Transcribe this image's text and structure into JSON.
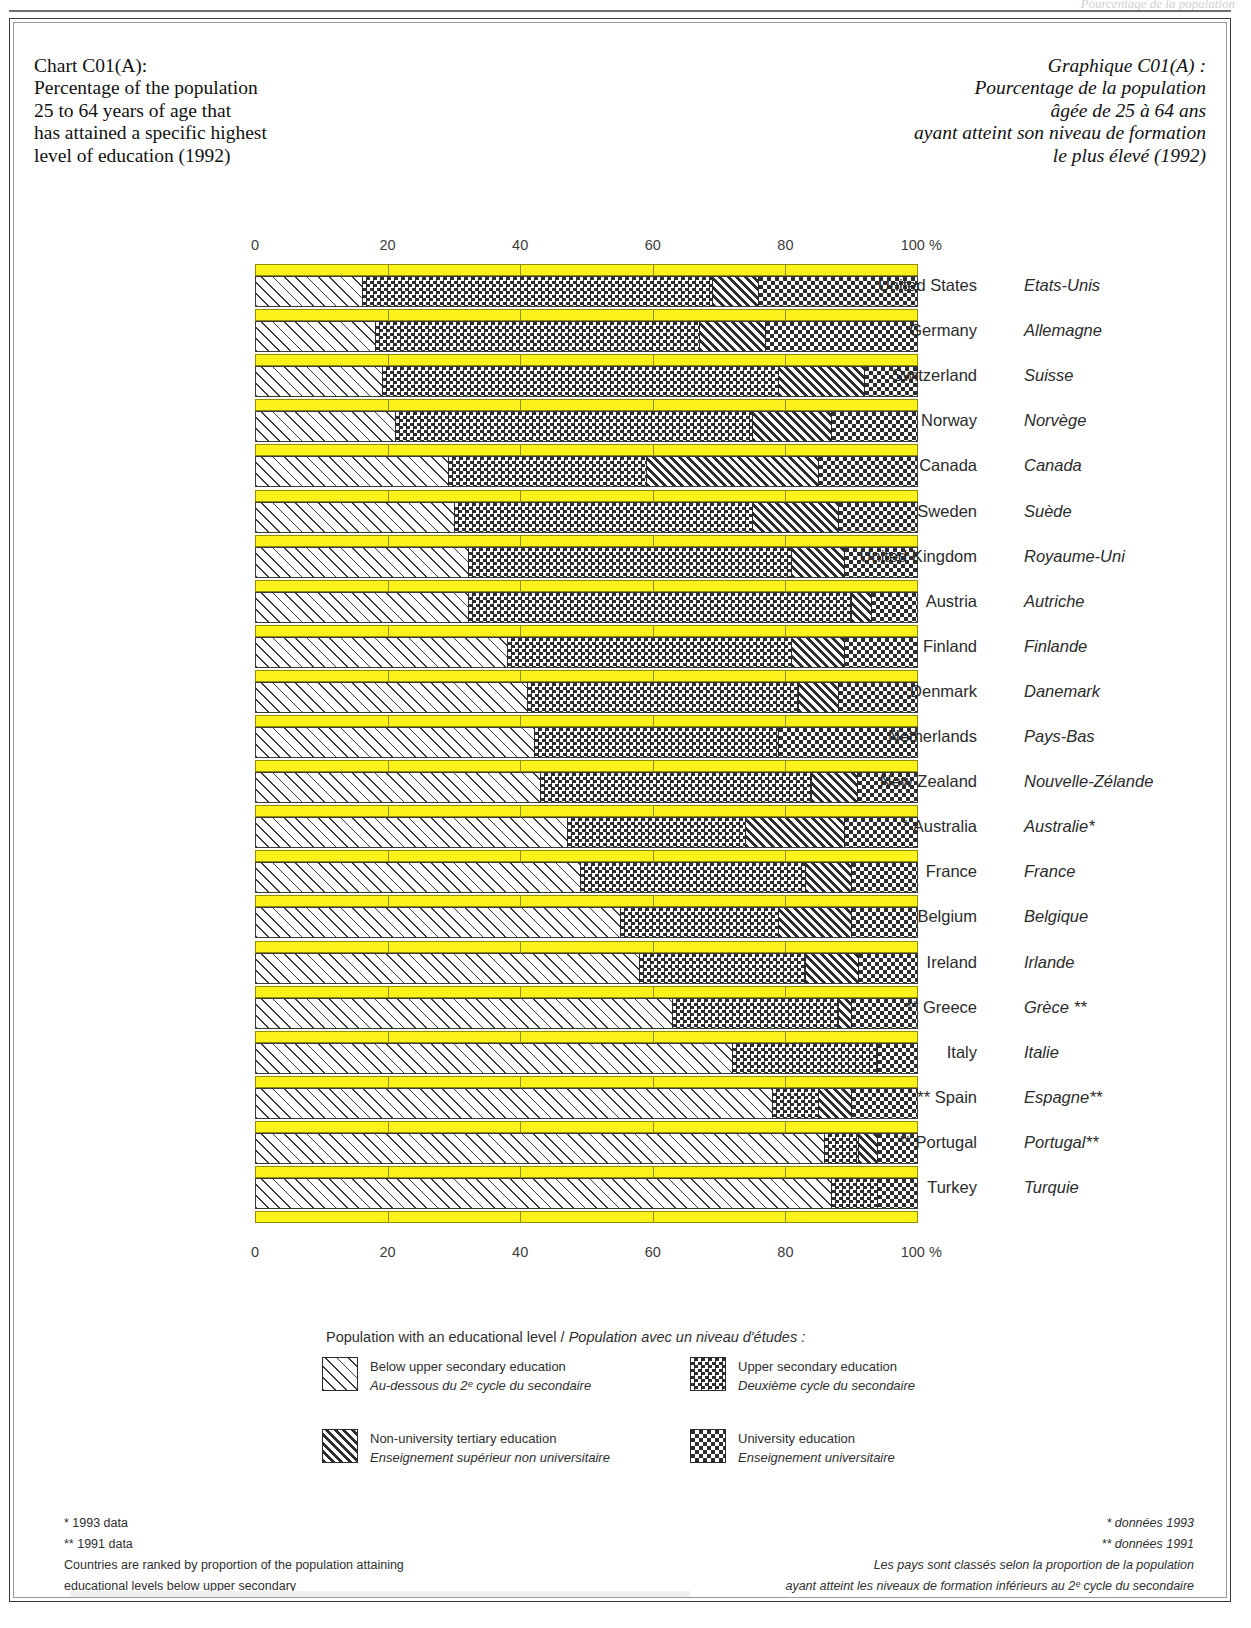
{
  "header_ghost": "Pourcentage de la population",
  "title_en": [
    "Chart C01(A):",
    "Percentage of the population",
    "25 to 64 years of age that",
    "has attained a specific highest",
    "level of education (1992)"
  ],
  "title_fr": [
    "Graphique C01(A) :",
    "Pourcentage de la population",
    "âgée de 25 à 64 ans",
    "ayant atteint son niveau de formation",
    "le plus élevé (1992)"
  ],
  "axis": {
    "ticks": [
      "0",
      "20",
      "40",
      "60",
      "80",
      "100 %"
    ],
    "tick_values": [
      0,
      20,
      40,
      60,
      80,
      100
    ]
  },
  "legend": {
    "title_en": "Population with an educational level",
    "separator": "/",
    "title_fr": "Population avec un niveau d'études :",
    "items": [
      {
        "key": "below",
        "en": "Below upper secondary education",
        "fr": "Au-dessous du 2ᵉ cycle du secondaire"
      },
      {
        "key": "upper",
        "en": "Upper secondary education",
        "fr": "Deuxième cycle du secondaire"
      },
      {
        "key": "nonuni",
        "en": "Non-university tertiary education",
        "fr": "Enseignement supérieur non universitaire"
      },
      {
        "key": "uni",
        "en": "University education",
        "fr": "Enseignement universitaire"
      }
    ]
  },
  "footnotes_en": [
    "* 1993 data",
    "** 1991 data",
    "Countries are ranked by proportion of the population attaining",
    "educational levels below upper secondary"
  ],
  "footnotes_fr": [
    "* données 1993",
    "** données 1991",
    "Les pays sont classés selon la proportion de la population",
    "ayant atteint les niveaux de formation inférieurs au 2ᵉ cycle du secondaire"
  ],
  "colors": {
    "yellow": "#FBF21C",
    "yellow_border": "#8F8F00",
    "ink": "#2E2E2E",
    "frame": "#3A3A3A"
  },
  "chart_data": {
    "type": "bar",
    "orientation": "horizontal",
    "stacked": true,
    "xlabel": "%",
    "ylabel": "",
    "xlim": [
      0,
      100
    ],
    "grid": true,
    "legend_position": "bottom",
    "series": [
      {
        "name": "Below upper secondary education",
        "key": "below"
      },
      {
        "name": "Upper secondary education",
        "key": "upper"
      },
      {
        "name": "Non-university tertiary education",
        "key": "nonuni"
      },
      {
        "name": "University education",
        "key": "uni"
      }
    ],
    "categories": [
      "United States",
      "Germany",
      "Switzerland",
      "Norway",
      "Canada",
      "Sweden",
      "United Kingdom",
      "Austria",
      "Finland",
      "Denmark",
      "Netherlands",
      "New Zealand",
      "* Australia",
      "France",
      "Belgium",
      "Ireland",
      "** Greece",
      "Italy",
      "** Spain",
      "** Portugal",
      "Turkey"
    ],
    "categories_fr": [
      "Etats-Unis",
      "Allemagne",
      "Suisse",
      "Norvège",
      "Canada",
      "Suède",
      "Royaume-Uni",
      "Autriche",
      "Finlande",
      "Danemark",
      "Pays-Bas",
      "Nouvelle-Zélande",
      "Australie*",
      "France",
      "Belgique",
      "Irlande",
      "Grèce **",
      "Italie",
      "Espagne**",
      "Portugal**",
      "Turquie"
    ],
    "rows": [
      {
        "country": "United States",
        "country_fr": "Etats-Unis",
        "below": 16,
        "upper": 53,
        "nonuni": 7,
        "uni": 24
      },
      {
        "country": "Germany",
        "country_fr": "Allemagne",
        "below": 18,
        "upper": 49,
        "nonuni": 10,
        "uni": 23
      },
      {
        "country": "Switzerland",
        "country_fr": "Suisse",
        "below": 19,
        "upper": 60,
        "nonuni": 13,
        "uni": 8
      },
      {
        "country": "Norway",
        "country_fr": "Norvège",
        "below": 21,
        "upper": 54,
        "nonuni": 12,
        "uni": 13
      },
      {
        "country": "Canada",
        "country_fr": "Canada",
        "below": 29,
        "upper": 30,
        "nonuni": 26,
        "uni": 15
      },
      {
        "country": "Sweden",
        "country_fr": "Suède",
        "below": 30,
        "upper": 45,
        "nonuni": 13,
        "uni": 12
      },
      {
        "country": "United Kingdom",
        "country_fr": "Royaume-Uni",
        "below": 32,
        "upper": 49,
        "nonuni": 8,
        "uni": 11
      },
      {
        "country": "Austria",
        "country_fr": "Autriche",
        "below": 32,
        "upper": 58,
        "nonuni": 3,
        "uni": 7
      },
      {
        "country": "Finland",
        "country_fr": "Finlande",
        "below": 38,
        "upper": 43,
        "nonuni": 8,
        "uni": 11
      },
      {
        "country": "Denmark",
        "country_fr": "Danemark",
        "below": 41,
        "upper": 41,
        "nonuni": 6,
        "uni": 12
      },
      {
        "country": "Netherlands",
        "country_fr": "Pays-Bas",
        "below": 42,
        "upper": 37,
        "nonuni": 0,
        "uni": 21
      },
      {
        "country": "New Zealand",
        "country_fr": "Nouvelle-Zélande",
        "below": 43,
        "upper": 41,
        "nonuni": 7,
        "uni": 9
      },
      {
        "country": "* Australia",
        "country_fr": "Australie*",
        "below": 47,
        "upper": 27,
        "nonuni": 15,
        "uni": 11
      },
      {
        "country": "France",
        "country_fr": "France",
        "below": 49,
        "upper": 34,
        "nonuni": 7,
        "uni": 10
      },
      {
        "country": "Belgium",
        "country_fr": "Belgique",
        "below": 55,
        "upper": 24,
        "nonuni": 11,
        "uni": 10
      },
      {
        "country": "Ireland",
        "country_fr": "Irlande",
        "below": 58,
        "upper": 25,
        "nonuni": 8,
        "uni": 9
      },
      {
        "country": "** Greece",
        "country_fr": "Grèce **",
        "below": 63,
        "upper": 25,
        "nonuni": 2,
        "uni": 10
      },
      {
        "country": "Italy",
        "country_fr": "Italie",
        "below": 72,
        "upper": 22,
        "nonuni": 0,
        "uni": 6
      },
      {
        "country": "** Spain",
        "country_fr": "Espagne**",
        "below": 78,
        "upper": 7,
        "nonuni": 5,
        "uni": 10
      },
      {
        "country": "** Portugal",
        "country_fr": "Portugal**",
        "below": 86,
        "upper": 5,
        "nonuni": 3,
        "uni": 6
      },
      {
        "country": "Turkey",
        "country_fr": "Turquie",
        "below": 87,
        "upper": 7,
        "nonuni": 0,
        "uni": 6
      }
    ]
  }
}
